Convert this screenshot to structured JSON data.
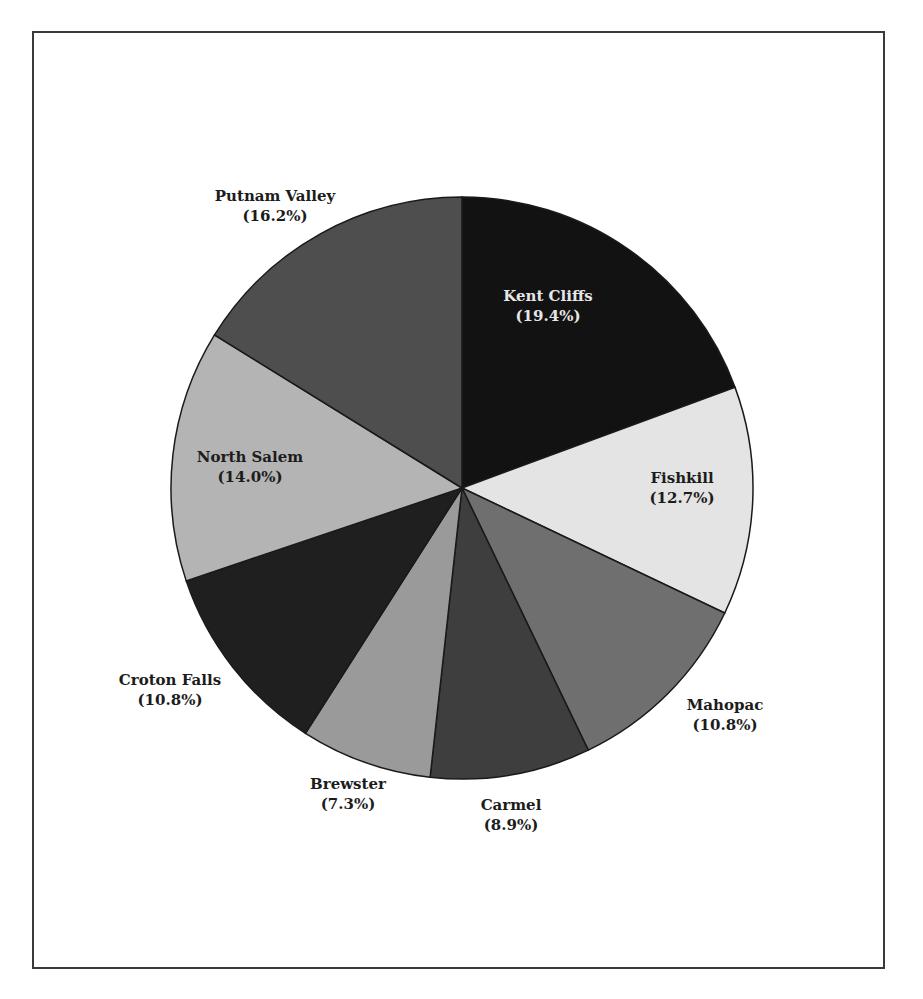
{
  "chart_data": {
    "type": "pie",
    "title": "",
    "start_angle_deg": 0,
    "direction": "clockwise",
    "slices": [
      {
        "label": "Kent Cliffs",
        "value": 19.4,
        "display": "(19.4%)",
        "color": "#121212",
        "label_color": "#e6e6e6"
      },
      {
        "label": "Fishkill",
        "value": 12.7,
        "display": "(12.7%)",
        "color": "#e4e4e4",
        "label_color": "#1c1c1c"
      },
      {
        "label": "Mahopac",
        "value": 10.8,
        "display": "(10.8%)",
        "color": "#6f6f6f",
        "label_color": "#1c1c1c"
      },
      {
        "label": "Carmel",
        "value": 8.9,
        "display": "(8.9%)",
        "color": "#3e3e3e",
        "label_color": "#1c1c1c"
      },
      {
        "label": "Brewster",
        "value": 7.3,
        "display": "(7.3%)",
        "color": "#9a9a9a",
        "label_color": "#1c1c1c"
      },
      {
        "label": "Croton Falls",
        "value": 10.8,
        "display": "(10.8%)",
        "color": "#1f1f1f",
        "label_color": "#1c1c1c"
      },
      {
        "label": "North Salem",
        "value": 14.0,
        "display": "(14.0%)",
        "color": "#b4b4b4",
        "label_color": "#1c1c1c"
      },
      {
        "label": "Putnam Valley",
        "value": 16.2,
        "display": "(16.2%)",
        "color": "#4e4e4e",
        "label_color": "#1c1c1c"
      }
    ],
    "legend": "none",
    "labels_position": "mixed (inside for Kent Cliffs, Fishkill, North Salem; outside for others)"
  },
  "labels": {
    "kent_cliffs": {
      "name": "Kent Cliffs",
      "pct": "(19.4%)"
    },
    "fishkill": {
      "name": "Fishkill",
      "pct": "(12.7%)"
    },
    "mahopac": {
      "name": "Mahopac",
      "pct": "(10.8%)"
    },
    "carmel": {
      "name": "Carmel",
      "pct": "(8.9%)"
    },
    "brewster": {
      "name": "Brewster",
      "pct": "(7.3%)"
    },
    "croton_falls": {
      "name": "Croton Falls",
      "pct": "(10.8%)"
    },
    "north_salem": {
      "name": "North Salem",
      "pct": "(14.0%)"
    },
    "putnam_valley": {
      "name": "Putnam Valley",
      "pct": "(16.2%)"
    }
  }
}
